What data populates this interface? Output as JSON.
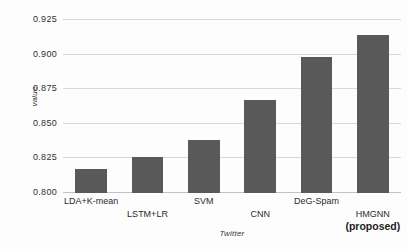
{
  "chart_data": {
    "type": "bar",
    "title": "",
    "xlabel": "Twitter",
    "ylabel": "value",
    "categories": [
      "LDA+K-mean",
      "LSTM+LR",
      "SVM",
      "CNN",
      "DeG-Spam",
      "HMGNN (proposed)"
    ],
    "category_lines": [
      {
        "line1": "LDA+K-mean",
        "line2": ""
      },
      {
        "line1": "LSTM+LR",
        "line2": ""
      },
      {
        "line1": "SVM",
        "line2": ""
      },
      {
        "line1": "CNN",
        "line2": ""
      },
      {
        "line1": "DeG-Spam",
        "line2": ""
      },
      {
        "line1": "HMGNN",
        "line2": "(proposed)"
      }
    ],
    "values": [
      0.817,
      0.826,
      0.838,
      0.867,
      0.898,
      0.914
    ],
    "ylim": [
      0.8,
      0.925
    ],
    "yticks": [
      0.8,
      0.825,
      0.85,
      0.875,
      0.9,
      0.925
    ],
    "ytick_labels": [
      "0.800",
      "0.825",
      "0.850",
      "0.875",
      "0.900",
      "0.925"
    ],
    "grid": true,
    "legend": "none",
    "bar_color": "#595959",
    "grid_color": "#d9d9d9",
    "background": "#fdfdfd"
  }
}
